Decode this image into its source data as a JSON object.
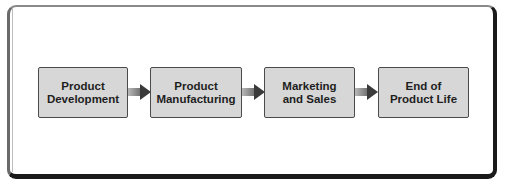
{
  "diagram": {
    "type": "flow",
    "direction": "left-to-right",
    "stages": [
      {
        "line1": "Product",
        "line2": "Development"
      },
      {
        "line1": "Product",
        "line2": "Manufacturing"
      },
      {
        "line1": "Marketing",
        "line2": "and Sales"
      },
      {
        "line1": "End of",
        "line2": "Product Life"
      }
    ],
    "connections": [
      {
        "from": 0,
        "to": 1
      },
      {
        "from": 1,
        "to": 2
      },
      {
        "from": 2,
        "to": 3
      }
    ],
    "colors": {
      "box_fill": "#d7d7d7",
      "box_border": "#4a4a4a",
      "arrow_head": "#3a3a3a",
      "frame_dark": "#1a1a1a"
    }
  }
}
